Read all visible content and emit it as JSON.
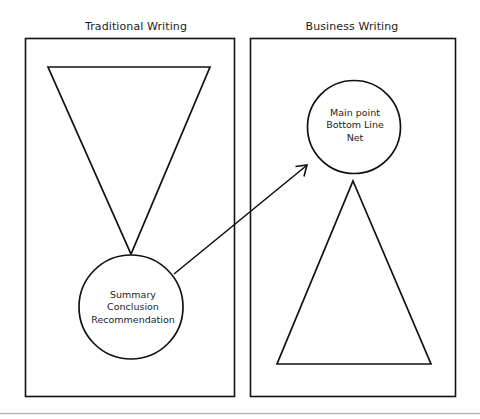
{
  "figure": {
    "background_color": "#ffffff",
    "stroke_color": "#111111",
    "panels": [
      {
        "id": "traditional",
        "title": "Traditional Writing",
        "shapes": [
          {
            "name": "inverted-triangle",
            "type": "triangle",
            "orientation": "point-down"
          },
          {
            "name": "conclusion-circle",
            "type": "circle"
          }
        ],
        "circle_text_lines": [
          "Summary",
          "Conclusion",
          "Recommendation"
        ]
      },
      {
        "id": "business",
        "title": "Business Writing",
        "shapes": [
          {
            "name": "main-point-circle",
            "type": "circle"
          },
          {
            "name": "upright-triangle",
            "type": "triangle",
            "orientation": "point-up"
          }
        ],
        "circle_text_lines": [
          "Main point",
          "Bottom Line",
          "Net"
        ]
      }
    ],
    "connector": {
      "name": "flow-arrow",
      "from": "conclusion-circle",
      "to": "main-point-circle",
      "style": "single-headed arrow"
    },
    "footer_rule": {
      "name": "page-rule",
      "color": "#b8b8b8"
    }
  },
  "traditional": {
    "title": "Traditional Writing",
    "circle": {
      "line1": "Summary",
      "line2": "Conclusion",
      "line3": "Recommendation"
    }
  },
  "business": {
    "title": "Business Writing",
    "circle": {
      "line1": "Main point",
      "line2": "Bottom Line",
      "line3": "Net"
    }
  }
}
